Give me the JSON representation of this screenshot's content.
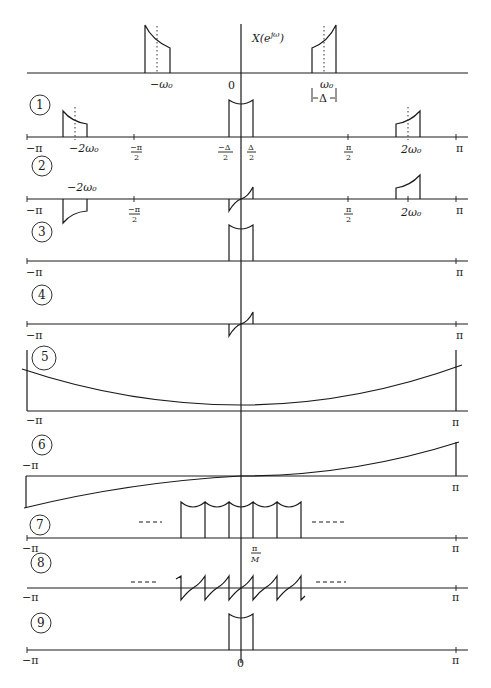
{
  "figure": {
    "title_label": "X(e^{jω})",
    "title_main": "X(e",
    "title_sup": "jω",
    "title_close": ")",
    "top": {
      "labels": {
        "neg_w0": "−ω₀",
        "zero": "0",
        "w0": "ω₀",
        "delta": "Δ"
      }
    },
    "panels": [
      {
        "id": "1",
        "number": "1",
        "labels": [
          "−π",
          "−2ω₀",
          "−π/2",
          "−Δ/2",
          "Δ/2",
          "π/2",
          "2ω₀",
          "π"
        ]
      },
      {
        "id": "2",
        "number": "2",
        "labels": [
          "−π",
          "−2ω₀",
          "−π/2",
          "π/2",
          "2ω₀",
          "π"
        ]
      },
      {
        "id": "3",
        "number": "3",
        "labels": [
          "−π",
          "π"
        ]
      },
      {
        "id": "4",
        "number": "4",
        "labels": [
          "−π",
          "π"
        ]
      },
      {
        "id": "5",
        "number": "5",
        "labels": [
          "−π",
          "π"
        ]
      },
      {
        "id": "6",
        "number": "6",
        "labels": [
          "−π",
          "π"
        ]
      },
      {
        "id": "7",
        "number": "7",
        "labels": [
          "−π",
          "π/M",
          "π"
        ]
      },
      {
        "id": "8",
        "number": "8",
        "labels": [
          "−π",
          "π"
        ]
      },
      {
        "id": "9",
        "number": "9",
        "labels": [
          "−π",
          "0",
          "π"
        ]
      }
    ],
    "tick_labels": {
      "neg_pi": "−π",
      "pi": "π",
      "neg_2w0": "−2ω₀",
      "pos_2w0": "2ω₀",
      "neg_pi_num": "−π",
      "pi_num": "π",
      "two": "2",
      "neg_delta_num": "−Δ",
      "delta_num": "Δ",
      "pi_over_M_num": "π",
      "M": "M",
      "zero": "0"
    },
    "ellipsis": "----"
  }
}
